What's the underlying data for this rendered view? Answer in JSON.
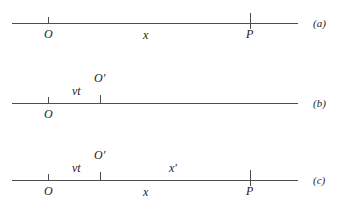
{
  "figure": {
    "line_color": "#4d4d4d",
    "text_color": "#1a1a1a",
    "background": "#ffffff"
  },
  "panels": [
    {
      "tag": "(a)",
      "axis": {
        "x1": 12,
        "x2": 298,
        "y": 23
      },
      "ticks": [
        {
          "name": "origin-O",
          "x": 48,
          "top": 17,
          "height": 7
        },
        {
          "name": "point-P",
          "x": 250,
          "top": 13,
          "height": 16
        }
      ],
      "labels": [
        {
          "name": "label-O",
          "text": "O",
          "x": 44,
          "y": 28
        },
        {
          "name": "label-x",
          "text": "x",
          "x": 143,
          "y": 29
        },
        {
          "name": "label-P",
          "text": "P",
          "x": 246,
          "y": 28
        }
      ]
    },
    {
      "tag": "(b)",
      "axis": {
        "x1": 12,
        "x2": 298,
        "y": 103
      },
      "ticks": [
        {
          "name": "origin-O",
          "x": 48,
          "top": 97,
          "height": 7
        },
        {
          "name": "origin-O-prime",
          "x": 100,
          "top": 95,
          "height": 8
        }
      ],
      "labels": [
        {
          "name": "label-O",
          "text": "O",
          "x": 44,
          "y": 108
        },
        {
          "name": "label-vt",
          "text": "vt",
          "x": 72,
          "y": 85
        },
        {
          "name": "label-O-prime",
          "text": "O′",
          "x": 94,
          "y": 72
        }
      ]
    },
    {
      "tag": "(c)",
      "axis": {
        "x1": 12,
        "x2": 298,
        "y": 180
      },
      "ticks": [
        {
          "name": "origin-O",
          "x": 48,
          "top": 174,
          "height": 7
        },
        {
          "name": "origin-O-prime",
          "x": 100,
          "top": 172,
          "height": 8
        },
        {
          "name": "point-P",
          "x": 250,
          "top": 170,
          "height": 16
        }
      ],
      "labels": [
        {
          "name": "label-O",
          "text": "O",
          "x": 44,
          "y": 185
        },
        {
          "name": "label-vt",
          "text": "vt",
          "x": 72,
          "y": 162
        },
        {
          "name": "label-O-prime",
          "text": "O′",
          "x": 94,
          "y": 149
        },
        {
          "name": "label-x-prime",
          "text": "x′",
          "x": 169,
          "y": 162
        },
        {
          "name": "label-x",
          "text": "x",
          "x": 143,
          "y": 186
        },
        {
          "name": "label-P",
          "text": "P",
          "x": 246,
          "y": 185
        }
      ]
    }
  ],
  "panel_tags": [
    {
      "name": "panel-tag-a",
      "text": "(a)",
      "x": 313,
      "y": 18
    },
    {
      "name": "panel-tag-b",
      "text": "(b)",
      "x": 313,
      "y": 98
    },
    {
      "name": "panel-tag-c",
      "text": "(c)",
      "x": 313,
      "y": 175
    }
  ]
}
